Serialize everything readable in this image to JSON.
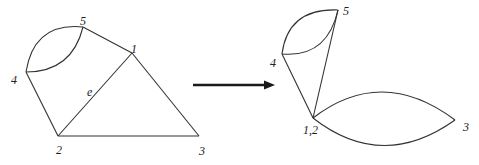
{
  "diagram": {
    "type": "graph-edge-contraction",
    "left_graph": {
      "vertices": [
        {
          "id": "1",
          "label": "1"
        },
        {
          "id": "2",
          "label": "2"
        },
        {
          "id": "3",
          "label": "3"
        },
        {
          "id": "4",
          "label": "4"
        },
        {
          "id": "5",
          "label": "5"
        }
      ],
      "edges": [
        {
          "from": "4",
          "to": "5",
          "kind": "curved-upper"
        },
        {
          "from": "4",
          "to": "5",
          "kind": "curved-lower"
        },
        {
          "from": "5",
          "to": "1",
          "kind": "straight"
        },
        {
          "from": "4",
          "to": "2",
          "kind": "straight"
        },
        {
          "from": "2",
          "to": "1",
          "kind": "straight",
          "label": "e"
        },
        {
          "from": "1",
          "to": "3",
          "kind": "straight"
        },
        {
          "from": "2",
          "to": "3",
          "kind": "straight"
        }
      ],
      "edge_label": "e"
    },
    "arrow": {
      "direction": "right"
    },
    "right_graph": {
      "vertices": [
        {
          "id": "12",
          "label": "1,2"
        },
        {
          "id": "3",
          "label": "3"
        },
        {
          "id": "4",
          "label": "4"
        },
        {
          "id": "5",
          "label": "5"
        }
      ],
      "edges": [
        {
          "from": "4",
          "to": "5",
          "kind": "curved-upper"
        },
        {
          "from": "4",
          "to": "5",
          "kind": "curved-lower"
        },
        {
          "from": "4",
          "to": "12",
          "kind": "straight"
        },
        {
          "from": "5",
          "to": "12",
          "kind": "straight"
        },
        {
          "from": "12",
          "to": "3",
          "kind": "curved-upper"
        },
        {
          "from": "12",
          "to": "3",
          "kind": "curved-lower"
        }
      ]
    },
    "colors": {
      "stroke": "#333333",
      "arrow": "#1a1a1a",
      "background": "#ffffff"
    }
  }
}
